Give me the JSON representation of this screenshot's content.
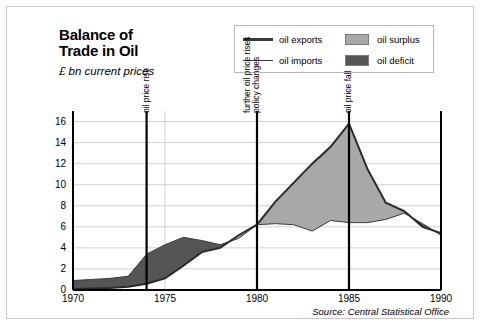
{
  "header": {
    "title_line1": "Balance of",
    "title_line2": "Trade in Oil",
    "subtitle": "£ bn current prices"
  },
  "legend": {
    "items": [
      {
        "label": "oil exports",
        "marker": "thick-line",
        "color": "#3a3a3a"
      },
      {
        "label": "oil imports",
        "marker": "thin-line",
        "color": "#3a3a3a"
      },
      {
        "label": "oil surplus",
        "marker": "swatch",
        "color": "#a8a8a8"
      },
      {
        "label": "oil deficit",
        "marker": "swatch",
        "color": "#555555"
      }
    ]
  },
  "source": "Source: Central Statistical Office",
  "chart_data": {
    "type": "area",
    "title": "Balance of Trade in Oil",
    "subtitle": "£ bn current prices",
    "xlabel": "",
    "ylabel": "£ bn current prices",
    "xlim": [
      1970,
      1990
    ],
    "ylim": [
      0,
      17
    ],
    "yticks": [
      0,
      2,
      4,
      6,
      8,
      10,
      12,
      14,
      16
    ],
    "xticks": [
      1970,
      1975,
      1980,
      1985,
      1990
    ],
    "grid": true,
    "legend_position": "top-right",
    "x": [
      1970,
      1971,
      1972,
      1973,
      1974,
      1975,
      1976,
      1977,
      1978,
      1979,
      1980,
      1981,
      1982,
      1983,
      1984,
      1985,
      1986,
      1987,
      1988,
      1989,
      1990
    ],
    "series": [
      {
        "name": "oil exports",
        "values": [
          0.1,
          0.15,
          0.2,
          0.3,
          0.6,
          1.1,
          2.3,
          3.6,
          4.0,
          5.2,
          6.2,
          8.4,
          10.2,
          12.0,
          13.6,
          15.8,
          11.5,
          8.3,
          7.5,
          6.0,
          5.4
        ]
      },
      {
        "name": "oil imports",
        "values": [
          0.9,
          1.0,
          1.1,
          1.3,
          3.4,
          4.3,
          5.0,
          4.7,
          4.3,
          4.9,
          6.2,
          6.3,
          6.2,
          5.6,
          6.6,
          6.4,
          6.4,
          6.7,
          7.3,
          6.3,
          5.2
        ]
      }
    ],
    "bands": [
      {
        "name": "oil deficit",
        "between": [
          "oil imports",
          "oil exports"
        ],
        "when": "imports > exports",
        "color": "#555555",
        "span": [
          1970,
          1980
        ]
      },
      {
        "name": "oil surplus",
        "between": [
          "oil exports",
          "oil imports"
        ],
        "when": "exports > imports",
        "color": "#a8a8a8",
        "span": [
          1980,
          1990
        ]
      }
    ],
    "annotations": [
      {
        "label": "oil price rise",
        "x": 1974,
        "orientation": "vertical"
      },
      {
        "label": "policy changes",
        "x": 1980,
        "orientation": "vertical"
      },
      {
        "label": "further oil price rises",
        "x": 1980,
        "orientation": "vertical"
      },
      {
        "label": "oil price fall",
        "x": 1985,
        "orientation": "vertical"
      }
    ]
  }
}
